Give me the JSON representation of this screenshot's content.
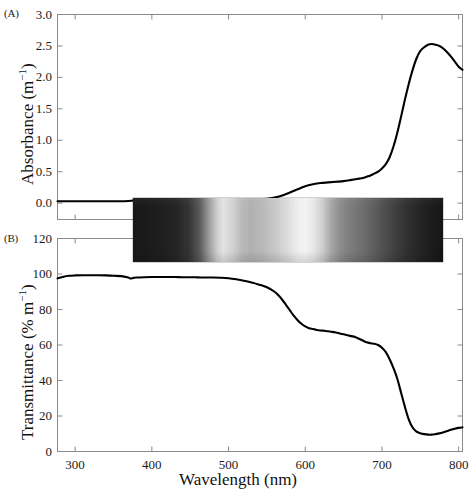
{
  "figure": {
    "xlabel": "Wavelength (nm)",
    "x_unit": "nm",
    "background_color": "#ffffff",
    "line_color": "#000000",
    "axis_color": "#8a8a8a"
  },
  "panel_a": {
    "tag": "(A)",
    "ylabel_text": "Absorbance (m",
    "ylabel_sup": "−1",
    "ylabel_close": ")",
    "ylabel_full": "Absorbance (m−1)"
  },
  "panel_b": {
    "tag": "(B)",
    "ylabel_text": "Transmittance (% m",
    "ylabel_sup": "−1",
    "ylabel_close": ")",
    "ylabel_full": "Transmittance (% m−1)"
  },
  "xticks": [
    300,
    400,
    500,
    600,
    700,
    800
  ],
  "xtick_labels": [
    "300",
    "400",
    "500",
    "600",
    "700",
    "800"
  ],
  "panel_a_yticks": [
    0.0,
    0.5,
    1.0,
    1.5,
    2.0,
    2.5,
    3.0
  ],
  "panel_a_ytick_labels": [
    "0.0",
    "0.5",
    "1.0",
    "1.5",
    "2.0",
    "2.5",
    "3.0"
  ],
  "panel_b_yticks": [
    0,
    20,
    40,
    60,
    80,
    100,
    120
  ],
  "panel_b_ytick_labels": [
    "0",
    "20",
    "40",
    "60",
    "80",
    "100",
    "120"
  ],
  "spectrum_strip": {
    "name": "spectral-photograph-strip",
    "x_start_nm": 290,
    "x_end_nm": 772,
    "description": "grayscale photographed transmission spectrum band"
  },
  "chart_data": [
    {
      "type": "line",
      "panel": "A",
      "title": "",
      "xlabel": "Wavelength (nm)",
      "ylabel": "Absorbance (m−1)",
      "xlim": [
        277,
        805
      ],
      "ylim": [
        -0.26,
        3.0
      ],
      "xticks": [
        300,
        400,
        500,
        600,
        700,
        800
      ],
      "yticks": [
        0.0,
        0.5,
        1.0,
        1.5,
        2.0,
        2.5,
        3.0
      ],
      "grid": false,
      "legend": "none",
      "series": [
        {
          "name": "Absorbance",
          "color": "#000000",
          "x": [
            277,
            290,
            300,
            310,
            320,
            330,
            340,
            350,
            360,
            370,
            375,
            380,
            390,
            400,
            410,
            420,
            430,
            440,
            450,
            460,
            470,
            480,
            490,
            500,
            510,
            520,
            530,
            540,
            550,
            560,
            570,
            580,
            590,
            600,
            610,
            620,
            630,
            640,
            650,
            660,
            665,
            670,
            675,
            680,
            685,
            690,
            695,
            700,
            705,
            710,
            715,
            720,
            725,
            730,
            735,
            740,
            745,
            750,
            755,
            760,
            765,
            770,
            775,
            780,
            785,
            790,
            795,
            800,
            805
          ],
          "y": [
            0.03,
            0.03,
            0.03,
            0.03,
            0.03,
            0.03,
            0.03,
            0.03,
            0.03,
            0.035,
            0.04,
            0.04,
            0.04,
            0.04,
            0.04,
            0.04,
            0.04,
            0.04,
            0.04,
            0.04,
            0.045,
            0.045,
            0.05,
            0.05,
            0.05,
            0.05,
            0.055,
            0.06,
            0.07,
            0.09,
            0.12,
            0.17,
            0.22,
            0.27,
            0.3,
            0.32,
            0.33,
            0.34,
            0.35,
            0.37,
            0.38,
            0.39,
            0.4,
            0.42,
            0.44,
            0.47,
            0.5,
            0.55,
            0.62,
            0.73,
            0.9,
            1.12,
            1.38,
            1.65,
            1.9,
            2.12,
            2.3,
            2.42,
            2.48,
            2.52,
            2.53,
            2.52,
            2.5,
            2.46,
            2.4,
            2.33,
            2.25,
            2.17,
            2.12
          ]
        }
      ]
    },
    {
      "type": "line",
      "panel": "B",
      "title": "",
      "xlabel": "Wavelength (nm)",
      "ylabel": "Transmittance (% m−1)",
      "xlim": [
        277,
        805
      ],
      "ylim": [
        0,
        120
      ],
      "xticks": [
        300,
        400,
        500,
        600,
        700,
        800
      ],
      "yticks": [
        0,
        20,
        40,
        60,
        80,
        100,
        120
      ],
      "grid": false,
      "legend": "none",
      "series": [
        {
          "name": "Transmittance",
          "color": "#000000",
          "x": [
            277,
            285,
            292,
            300,
            310,
            320,
            330,
            340,
            350,
            360,
            368,
            372,
            376,
            380,
            390,
            400,
            410,
            420,
            430,
            440,
            450,
            460,
            470,
            480,
            490,
            500,
            510,
            520,
            530,
            540,
            550,
            560,
            565,
            570,
            575,
            580,
            585,
            590,
            595,
            600,
            605,
            610,
            615,
            620,
            625,
            630,
            635,
            640,
            645,
            650,
            655,
            660,
            665,
            670,
            675,
            680,
            685,
            690,
            695,
            700,
            705,
            710,
            715,
            720,
            725,
            730,
            735,
            740,
            745,
            750,
            755,
            760,
            765,
            770,
            775,
            780,
            785,
            790,
            795,
            800,
            805
          ],
          "y": [
            97.5,
            98.5,
            99.0,
            99.2,
            99.3,
            99.3,
            99.3,
            99.2,
            99.0,
            98.8,
            98.2,
            97.5,
            97.8,
            98.0,
            98.2,
            98.3,
            98.3,
            98.3,
            98.3,
            98.2,
            98.2,
            98.1,
            98.0,
            98.0,
            97.9,
            97.6,
            97.0,
            96.2,
            95.2,
            94.0,
            92.5,
            90.0,
            88.0,
            85.5,
            82.5,
            79.5,
            76.5,
            74.0,
            72.0,
            70.5,
            69.5,
            69.0,
            68.5,
            68.2,
            68.0,
            67.7,
            67.4,
            67.0,
            66.5,
            66.0,
            65.5,
            65.0,
            64.5,
            63.5,
            62.5,
            61.5,
            61.0,
            60.7,
            60.0,
            58.5,
            56.0,
            52.0,
            47.0,
            41.0,
            33.0,
            25.0,
            18.0,
            13.5,
            11.2,
            10.3,
            9.8,
            9.5,
            9.5,
            9.8,
            10.2,
            10.8,
            11.5,
            12.2,
            12.8,
            13.3,
            13.6
          ]
        }
      ]
    }
  ]
}
